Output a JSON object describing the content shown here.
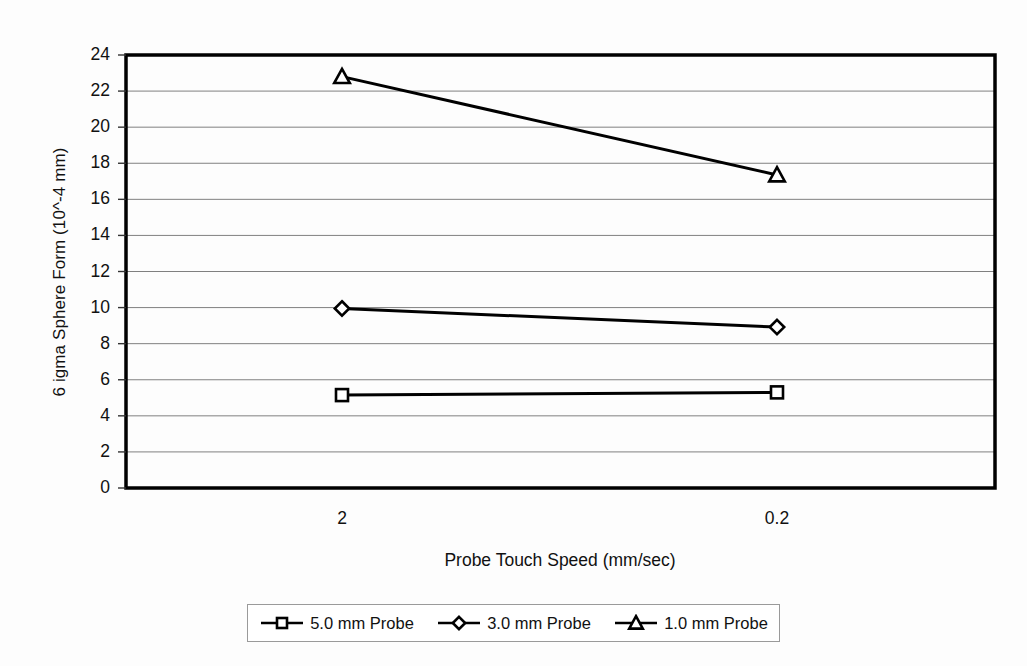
{
  "chart_data": {
    "type": "line",
    "title": "",
    "xlabel": "Probe Touch Speed (mm/sec)",
    "ylabel": "6 igma Sphere Form (10^-4 mm)",
    "categories": [
      "2",
      "0.2"
    ],
    "ylim": [
      0,
      24
    ],
    "ytick_step": 2,
    "yticks": [
      "24",
      "22",
      "20",
      "18",
      "16",
      "14",
      "12",
      "10",
      "8",
      "6",
      "4",
      "2",
      "0"
    ],
    "grid": "horizontal",
    "legend_position": "bottom",
    "series": [
      {
        "name": "5.0 mm Probe",
        "marker": "square",
        "values": [
          5.15,
          5.3
        ]
      },
      {
        "name": "3.0 mm Probe",
        "marker": "diamond",
        "values": [
          9.95,
          8.92
        ]
      },
      {
        "name": "1.0 mm Probe",
        "marker": "triangle",
        "values": [
          22.8,
          17.35
        ]
      }
    ],
    "colors": {
      "line": "#000000",
      "grid": "#808080",
      "axis": "#000000",
      "background": "#ffffff"
    }
  },
  "legend": {
    "items": [
      {
        "label": "5.0 mm Probe",
        "marker": "square"
      },
      {
        "label": "3.0 mm Probe",
        "marker": "diamond"
      },
      {
        "label": "1.0 mm Probe",
        "marker": "triangle"
      }
    ]
  }
}
